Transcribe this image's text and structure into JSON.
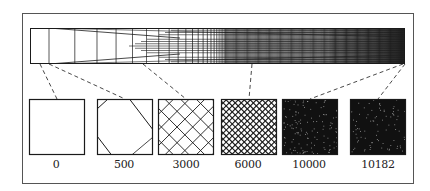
{
  "figure": {
    "frame_color": "#555555",
    "ink_color": "#1a1a1a",
    "strip": {
      "x": 30,
      "y": 28,
      "width": 375,
      "height": 36,
      "fill_gradient": "sparse-to-dense left to right"
    },
    "samples": [
      {
        "label": "0",
        "x": 29,
        "density": 0,
        "pattern": "empty"
      },
      {
        "label": "500",
        "x": 97,
        "density": 1,
        "pattern": "corner-cut diamond"
      },
      {
        "label": "3000",
        "x": 158,
        "density": 5,
        "pattern": "diagonal lattice"
      },
      {
        "label": "6000",
        "x": 221,
        "density": 13,
        "pattern": "fine diagonal lattice"
      },
      {
        "label": "10000",
        "x": 282,
        "density": 40,
        "pattern": "nearly solid"
      },
      {
        "label": "10182",
        "x": 350,
        "density": 60,
        "pattern": "solid"
      }
    ],
    "connectors": [
      {
        "from_x": 40,
        "to_sample": 0
      },
      {
        "from_x": 49,
        "to_sample": 1
      },
      {
        "from_x": 143,
        "to_sample": 2
      },
      {
        "from_x": 252,
        "to_sample": 3
      },
      {
        "from_x": 403,
        "to_sample": 4
      },
      {
        "from_x": 405,
        "to_sample": 5
      }
    ]
  }
}
